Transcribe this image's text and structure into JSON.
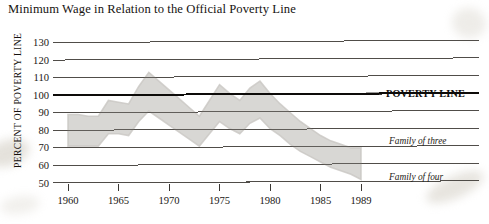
{
  "chart_data": {
    "type": "area",
    "title": "Minimum Wage in Relation to the Official Poverty Line",
    "xlabel": "",
    "ylabel": "PERCENT OF POVERTY LINE",
    "xlim": [
      1959,
      1990
    ],
    "ylim": [
      50,
      130
    ],
    "ytick_values": [
      50,
      60,
      70,
      80,
      90,
      100,
      110,
      120,
      130
    ],
    "ytick_labels": [
      "50",
      "60",
      "70",
      "80",
      "90",
      "100",
      "110",
      "120",
      "130"
    ],
    "xtick_values": [
      1960,
      1965,
      1970,
      1975,
      1980,
      1985,
      1989
    ],
    "xtick_labels": [
      "1960",
      "1965",
      "1970",
      "1975",
      "1980",
      "1985",
      "1989"
    ],
    "grid": true,
    "grid_orientation": "horizontal",
    "reference_line": {
      "value": 100,
      "label": "POVERTY LINE",
      "emphasis": "bold"
    },
    "band_fill_color": "#d6d5d2",
    "legend_position": "right-inline",
    "x": [
      1960,
      1961,
      1962,
      1963,
      1964,
      1965,
      1966,
      1967,
      1968,
      1969,
      1970,
      1971,
      1972,
      1973,
      1974,
      1975,
      1976,
      1977,
      1978,
      1979,
      1980,
      1981,
      1982,
      1983,
      1984,
      1985,
      1986,
      1987,
      1988,
      1989
    ],
    "series": [
      {
        "name": "Family of three",
        "label": "Family of three",
        "role": "band-upper",
        "values": [
          89,
          89,
          88,
          88,
          97,
          96,
          95,
          105,
          113,
          108,
          103,
          98,
          93,
          88,
          97,
          106,
          101,
          97,
          104,
          108,
          101,
          95,
          90,
          85,
          81,
          77,
          74,
          72,
          70,
          70
        ]
      },
      {
        "name": "Family of four",
        "label": "Family of four",
        "role": "band-lower",
        "values": [
          71,
          71,
          71,
          71,
          78,
          78,
          77,
          85,
          91,
          87,
          83,
          79,
          75,
          71,
          78,
          85,
          81,
          78,
          84,
          87,
          81,
          77,
          72,
          68,
          65,
          62,
          59,
          57,
          55,
          52
        ]
      }
    ]
  }
}
